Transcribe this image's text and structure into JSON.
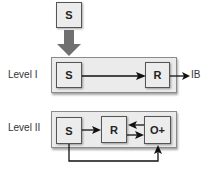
{
  "diagram": {
    "top_node": {
      "label": "S"
    },
    "levels": [
      {
        "label": "Level I",
        "nodes": [
          {
            "id": "S",
            "label": "S"
          },
          {
            "id": "R",
            "label": "R"
          }
        ],
        "output": "IB",
        "edges": [
          [
            "S",
            "R"
          ],
          [
            "R",
            "IB"
          ]
        ]
      },
      {
        "label": "Level II",
        "nodes": [
          {
            "id": "S",
            "label": "S"
          },
          {
            "id": "R",
            "label": "R"
          },
          {
            "id": "O+",
            "label": "O+"
          }
        ],
        "edges": [
          [
            "S",
            "R"
          ],
          [
            "R",
            "O+"
          ],
          [
            "O+",
            "R"
          ],
          [
            "S",
            "O+"
          ]
        ]
      }
    ],
    "colors": {
      "container_fill": "#ebebeb",
      "box_fill": "#ececec",
      "big_arrow": "#707070",
      "line": "#111111"
    }
  }
}
